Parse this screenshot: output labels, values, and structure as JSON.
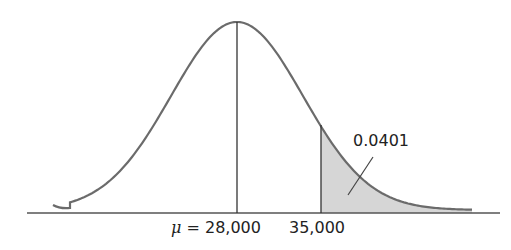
{
  "chart_data": {
    "type": "area",
    "title": "",
    "xlabel": "",
    "ylabel": "",
    "grid": false,
    "legend": null,
    "mean": 28000,
    "x_markers": [
      {
        "value": 28000,
        "label": "μ = 28,000"
      },
      {
        "value": 35000,
        "label": "35,000"
      }
    ],
    "shaded_region": {
      "from": 35000,
      "to": "infinity",
      "area": 0.0401
    },
    "annotations": [
      "0.0401"
    ],
    "colors": {
      "curve": "#6b6b6b",
      "shade": "#d4d4d4",
      "axis": "#555555"
    }
  },
  "labels": {
    "mu_symbol": "μ",
    "mean_label_rest": " = 28,000",
    "tail_label": "35,000",
    "area_label": "0.0401"
  }
}
